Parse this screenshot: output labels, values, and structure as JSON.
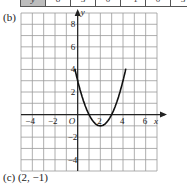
{
  "table": {
    "row_label": "y",
    "values": [
      "8",
      "3",
      "0",
      "−1",
      "0",
      "3"
    ]
  },
  "labels": {
    "part_b": "(b)",
    "part_c": "(c) (2, −1)"
  },
  "chart_data": {
    "type": "line",
    "title": "",
    "xlabel": "x",
    "ylabel": "y",
    "xlim": [
      -5,
      7
    ],
    "ylim": [
      -5,
      9
    ],
    "grid": true,
    "x_ticks": [
      -4,
      -2,
      2,
      4,
      6
    ],
    "y_ticks": [
      8,
      6,
      4,
      2,
      -2,
      -4
    ],
    "origin_label": "O",
    "series": [
      {
        "name": "y = x² − 4x + 3",
        "x": [
          -1,
          0,
          1,
          2,
          3,
          4,
          5
        ],
        "y": [
          8,
          3,
          0,
          -1,
          0,
          3,
          8
        ]
      }
    ],
    "vertex": [
      2,
      -1
    ]
  }
}
